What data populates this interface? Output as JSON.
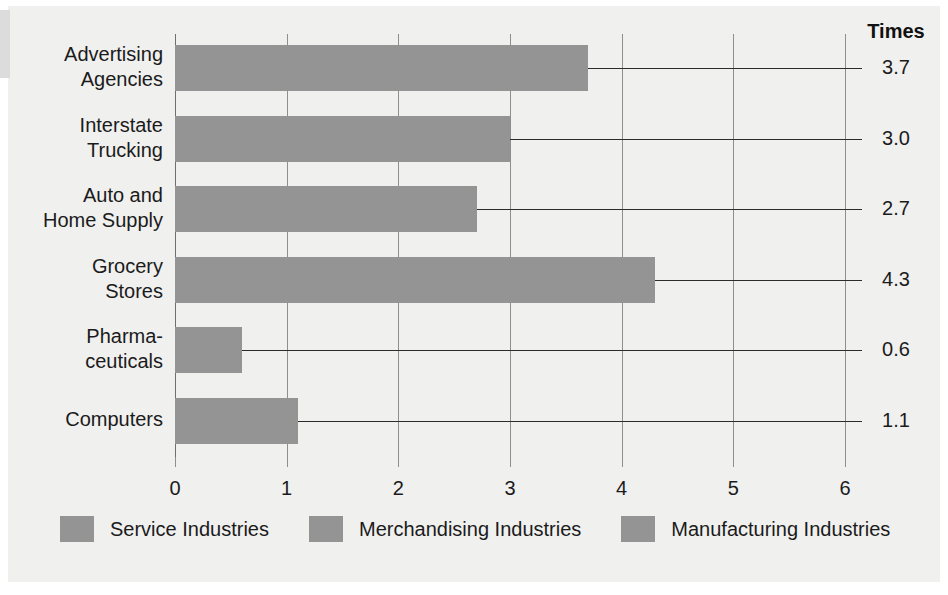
{
  "chart_data": {
    "type": "bar",
    "orientation": "horizontal",
    "title": "",
    "xlabel": "",
    "ylabel": "",
    "value_axis_title": "Times",
    "categories": [
      "Advertising\nAgencies",
      "Interstate\nTrucking",
      "Auto and\nHome Supply",
      "Grocery\nStores",
      "Pharma-\nceuticals",
      "Computers"
    ],
    "values": [
      3.7,
      3.0,
      2.7,
      4.3,
      0.6,
      1.1
    ],
    "value_labels": [
      "3.7",
      "3.0",
      "2.7",
      "4.3",
      "0.6",
      "1.1"
    ],
    "group_of_category": [
      "Service Industries",
      "Service Industries",
      "Merchandising Industries",
      "Merchandising Industries",
      "Manufacturing Industries",
      "Manufacturing Industries"
    ],
    "xlim": [
      0,
      6
    ],
    "xticks": [
      0,
      1,
      2,
      3,
      4,
      5,
      6
    ],
    "xtick_labels": [
      "0",
      "1",
      "2",
      "3",
      "4",
      "5",
      "6"
    ],
    "grid": true,
    "grid_axis": "x",
    "legend_position": "bottom",
    "legend": [
      "Service Industries",
      "Merchandising Industries",
      "Manufacturing Industries"
    ],
    "bar_color": "#949494",
    "gridline_color": "#8e8e8e",
    "leader_line_color": "#2b2b2b",
    "background_color": "#f0f0ef",
    "text_color": "#1b1b1b"
  },
  "axis": {
    "ticks": [
      {
        "label": "0",
        "value": 0
      },
      {
        "label": "1",
        "value": 1
      },
      {
        "label": "2",
        "value": 2
      },
      {
        "label": "3",
        "value": 3
      },
      {
        "label": "4",
        "value": 4
      },
      {
        "label": "5",
        "value": 5
      },
      {
        "label": "6",
        "value": 6
      }
    ]
  },
  "rows": [
    {
      "label": "Advertising\nAgencies",
      "value": 3.7,
      "value_label": "3.7"
    },
    {
      "label": "Interstate\nTrucking",
      "value": 3.0,
      "value_label": "3.0"
    },
    {
      "label": "Auto and\nHome Supply",
      "value": 2.7,
      "value_label": "2.7"
    },
    {
      "label": "Grocery\nStores",
      "value": 4.3,
      "value_label": "4.3"
    },
    {
      "label": "Pharma-\nceuticals",
      "value": 0.6,
      "value_label": "0.6"
    },
    {
      "label": "Computers",
      "value": 1.1,
      "value_label": "1.1"
    }
  ],
  "values_column": {
    "header": "Times"
  },
  "legend": {
    "items": [
      {
        "label": "Service Industries",
        "color": "#949494"
      },
      {
        "label": "Merchandising Industries",
        "color": "#949494"
      },
      {
        "label": "Manufacturing Industries",
        "color": "#949494"
      }
    ]
  }
}
